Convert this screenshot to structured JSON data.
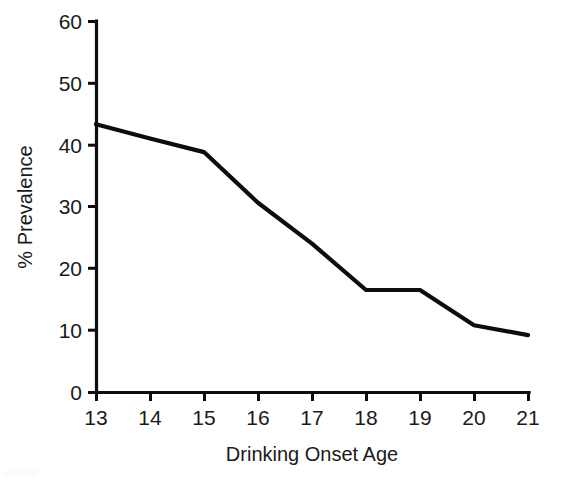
{
  "chart_data": {
    "type": "line",
    "title": "",
    "subtitle": "",
    "xlabel": "Drinking Onset Age",
    "ylabel": "% Prevalence",
    "x": [
      13,
      14,
      15,
      16,
      17,
      18,
      19,
      20,
      21
    ],
    "values": [
      43.3,
      41.0,
      38.8,
      30.6,
      24.0,
      16.5,
      16.5,
      10.8,
      9.2
    ],
    "series": [
      {
        "name": "% Prevalence",
        "values": [
          43.3,
          41.0,
          38.8,
          30.6,
          24.0,
          16.5,
          16.5,
          10.8,
          9.2
        ]
      }
    ],
    "xlim": [
      13,
      21
    ],
    "ylim": [
      0,
      60
    ],
    "x_tick_labels": [
      "13",
      "14",
      "15",
      "16",
      "17",
      "18",
      "19",
      "20",
      "21"
    ],
    "y_tick_labels": [
      "0",
      "10",
      "20",
      "30",
      "40",
      "50",
      "60"
    ],
    "y_ticks": [
      0,
      10,
      20,
      30,
      40,
      50,
      60
    ],
    "grid": false,
    "legend": false,
    "legend_position": "none",
    "line_color": "#0d0d0d",
    "background_color": "#ffffff",
    "axis_color": "#0d0d0d",
    "text_color": "#1a1a1a",
    "annotations": []
  },
  "geometry": {
    "plot_left": 96,
    "plot_right": 528,
    "plot_top": 21,
    "plot_bottom": 392,
    "x_step": 54,
    "y_per_unit": 6.1833
  }
}
